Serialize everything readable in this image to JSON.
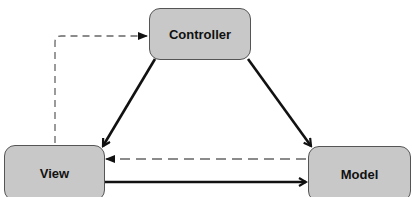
{
  "diagram": {
    "type": "MVC architecture",
    "nodes": [
      {
        "id": "controller",
        "label": "Controller"
      },
      {
        "id": "view",
        "label": "View"
      },
      {
        "id": "model",
        "label": "Model"
      }
    ],
    "edges": [
      {
        "from": "view",
        "to": "controller",
        "style": "dashed"
      },
      {
        "from": "controller",
        "to": "view",
        "style": "solid"
      },
      {
        "from": "controller",
        "to": "model",
        "style": "solid"
      },
      {
        "from": "model",
        "to": "view",
        "style": "dashed"
      },
      {
        "from": "view",
        "to": "model",
        "style": "solid"
      }
    ]
  },
  "colors": {
    "node_fill": "#c8c8c8",
    "node_border": "#555555",
    "edge": "#111111",
    "dashed_edge": "#666666"
  }
}
